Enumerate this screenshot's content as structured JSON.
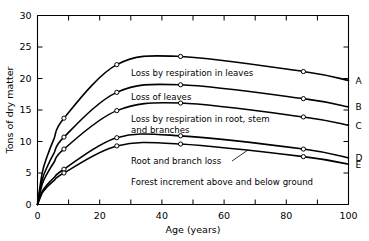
{
  "chart_data": {
    "type": "line",
    "title": "",
    "xlabel": "Age   (years)",
    "ylabel": "Tons of dry matter",
    "xlim": [
      0,
      100
    ],
    "ylim": [
      0,
      30
    ],
    "grid": false,
    "legend_position": "right-curve-labels",
    "x_ticks_major": [
      0,
      20,
      40,
      60,
      80,
      100
    ],
    "x_ticks_minor": [
      10,
      30,
      50,
      70,
      90
    ],
    "y_ticks_major": [
      0,
      5,
      10,
      15,
      20,
      25,
      30
    ],
    "x_tick_labels": [
      "0",
      "20",
      "40",
      "60",
      "80",
      "100"
    ],
    "y_tick_labels": [
      "0",
      "5",
      "10",
      "15",
      "20",
      "25",
      "30"
    ],
    "marker_x": [
      8.5,
      25.5,
      46,
      85.5
    ],
    "series": [
      {
        "name": "A",
        "letter": "A",
        "x": [
          0,
          8.5,
          25.5,
          46,
          85.5,
          100
        ],
        "values": [
          0,
          13.7,
          22.2,
          23.5,
          21.1,
          19.7
        ]
      },
      {
        "name": "B",
        "letter": "B",
        "x": [
          0,
          8.5,
          25.5,
          46,
          85.5,
          100
        ],
        "values": [
          0,
          10.7,
          17.8,
          19.0,
          16.8,
          15.5
        ]
      },
      {
        "name": "C",
        "letter": "C",
        "x": [
          0,
          8.5,
          25.5,
          46,
          85.5,
          100
        ],
        "values": [
          0,
          8.8,
          14.9,
          16.1,
          13.9,
          12.6
        ]
      },
      {
        "name": "D",
        "letter": "D",
        "x": [
          0,
          8.5,
          25.5,
          46,
          85.5,
          100
        ],
        "values": [
          0,
          5.6,
          10.6,
          10.9,
          8.8,
          7.4
        ]
      },
      {
        "name": "E",
        "letter": "E",
        "x": [
          0,
          8.5,
          25.5,
          46,
          85.5,
          100
        ],
        "values": [
          0,
          5.0,
          9.3,
          9.6,
          7.6,
          6.4
        ]
      }
    ],
    "annotations": [
      {
        "id": "ann-respiration-leaves",
        "text": "Loss by respiration in leaves",
        "x": 131,
        "y": 76
      },
      {
        "id": "ann-loss-of-leaves",
        "text": "Loss of leaves",
        "x": 131,
        "y": 100
      },
      {
        "id": "ann-respiration-root-line1",
        "text": "Loss by respiration in root, stem",
        "x": 131,
        "y": 122
      },
      {
        "id": "ann-respiration-root-line2",
        "text": "and branches",
        "x": 131,
        "y": 133
      },
      {
        "id": "ann-root-branch-loss",
        "text": "Root and branch loss",
        "x": 131,
        "y": 164
      },
      {
        "id": "ann-forest-increment",
        "text": "Forest increment above and below ground",
        "x": 131,
        "y": 185
      }
    ],
    "colors": {
      "curve": "#000000",
      "axis": "#000000",
      "background": "#ffffff",
      "marker_fill": "#ffffff"
    }
  }
}
